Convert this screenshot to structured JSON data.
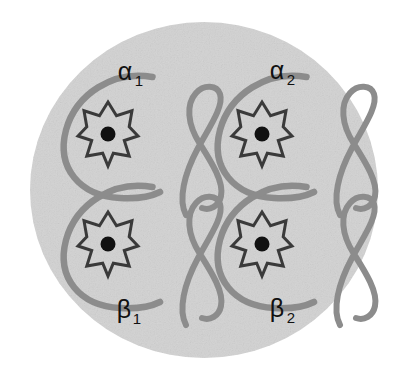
{
  "figure": {
    "name": "hemoglobin-tetramer-schematic",
    "caption": "",
    "background_color": "#ffffff",
    "cell_fill_color": "#d2d2d2",
    "chain_color": "#8c8c8c",
    "heme_outline_color": "#3a3a3a",
    "iron_color": "#111111",
    "label_color": "#111111"
  },
  "container": {
    "name": "cell-ellipse",
    "shape": "ellipse",
    "center_x": 204,
    "center_y": 190,
    "radius_x": 174,
    "radius_y": 168
  },
  "subunits": [
    {
      "id": "alpha-1",
      "label": "α",
      "subscript": "1",
      "label_x": 125,
      "label_y": 80,
      "center_x": 108,
      "center_y": 132,
      "position": "top-left"
    },
    {
      "id": "alpha-2",
      "label": "α",
      "subscript": "2",
      "label_x": 277,
      "label_y": 79,
      "center_x": 262,
      "center_y": 132,
      "position": "top-right"
    },
    {
      "id": "beta-1",
      "label": "β",
      "subscript": "1",
      "label_x": 124,
      "label_y": 318,
      "center_x": 108,
      "center_y": 242,
      "position": "bottom-left"
    },
    {
      "id": "beta-2",
      "label": "β",
      "subscript": "2",
      "label_x": 277,
      "label_y": 317,
      "center_x": 262,
      "center_y": 242,
      "position": "bottom-right"
    }
  ],
  "heme_group": {
    "name": "heme-star",
    "points": 8,
    "outer_radius": 30,
    "inner_radius": 17,
    "iron_dot_radius": 7.5
  },
  "globin_chain": {
    "name": "globin-c-curve",
    "description": "C-shaped polypeptide backbone open to the right",
    "stroke_width": 6.5
  },
  "chain_tail": {
    "name": "globin-tail-loop",
    "description": "cursive loop tail to the right of each C-curve",
    "stroke_width": 6.0
  }
}
